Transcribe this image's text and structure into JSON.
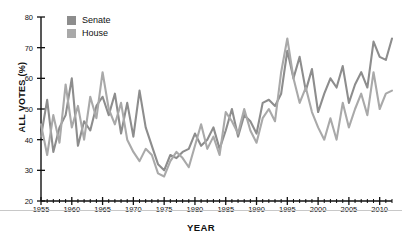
{
  "chart_data": {
    "type": "line",
    "title": "",
    "xlabel": "YEAR",
    "ylabel": "ALL VOTES (%)",
    "xlim": [
      1955,
      2012
    ],
    "ylim": [
      20,
      80
    ],
    "ytick_step": 10,
    "xtick_step": 5,
    "xminor_step": 1,
    "grid": false,
    "legend_position": "top-left",
    "ytick_labels": [
      "20",
      "30",
      "40",
      "50",
      "60",
      "70",
      "80"
    ],
    "xtick_labels": [
      "1955",
      "1960",
      "1965",
      "1970",
      "1975",
      "1980",
      "1985",
      "1990",
      "1995",
      "2000",
      "2005",
      "2010"
    ],
    "x": [
      1955,
      1956,
      1957,
      1958,
      1959,
      1960,
      1961,
      1962,
      1963,
      1964,
      1965,
      1966,
      1967,
      1968,
      1969,
      1970,
      1971,
      1972,
      1973,
      1974,
      1975,
      1976,
      1977,
      1978,
      1979,
      1980,
      1981,
      1982,
      1983,
      1984,
      1985,
      1986,
      1987,
      1988,
      1989,
      1990,
      1991,
      1992,
      1993,
      1994,
      1995,
      1996,
      1997,
      1998,
      1999,
      2000,
      2001,
      2002,
      2003,
      2004,
      2005,
      2006,
      2007,
      2008,
      2009,
      2010,
      2011,
      2012
    ],
    "series": [
      {
        "name": "Senate",
        "color": "#8d8d8d",
        "values": [
          41,
          53,
          36,
          44,
          48,
          60,
          38,
          46,
          43,
          51,
          54,
          48,
          55,
          42,
          52,
          41,
          56,
          44,
          38,
          32,
          30,
          35,
          34,
          36,
          37,
          42,
          38,
          40,
          44,
          37,
          43,
          50,
          41,
          48,
          46,
          42,
          52,
          53,
          51,
          55,
          69,
          60,
          67,
          56,
          63,
          49,
          55,
          60,
          57,
          64,
          52,
          58,
          62,
          57,
          72,
          67,
          66,
          73
        ]
      },
      {
        "name": "House",
        "color": "#a9a9a9",
        "values": [
          45,
          35,
          48,
          39,
          58,
          44,
          51,
          40,
          54,
          47,
          62,
          50,
          45,
          52,
          40,
          36,
          33,
          37,
          35,
          29,
          28,
          33,
          36,
          34,
          31,
          38,
          45,
          37,
          41,
          35,
          49,
          46,
          42,
          50,
          43,
          39,
          47,
          50,
          46,
          62,
          73,
          60,
          52,
          57,
          49,
          44,
          40,
          47,
          40,
          52,
          44,
          50,
          55,
          48,
          62,
          50,
          55,
          56
        ]
      }
    ]
  },
  "legend": {
    "items": [
      {
        "label": "Senate",
        "color": "#8d8d8d"
      },
      {
        "label": "House",
        "color": "#a9a9a9"
      }
    ]
  }
}
